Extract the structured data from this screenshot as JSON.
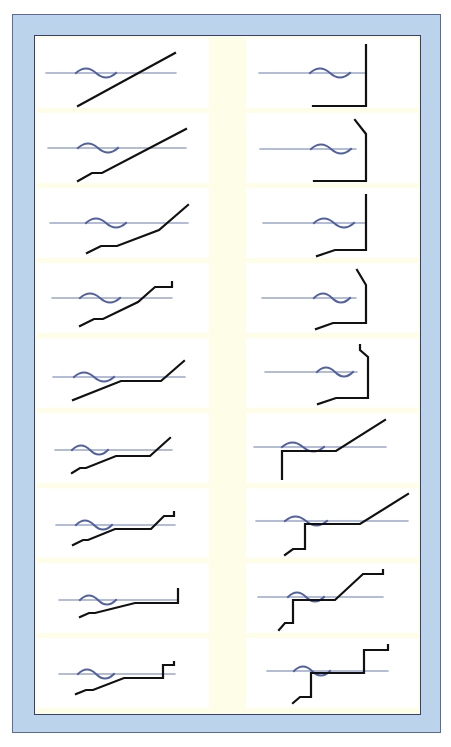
{
  "colors": {
    "frame": "#bcd3ec",
    "frame_border": "#5a6a9a",
    "panel_border": "#3a3f6a",
    "cell_bg": "#ffffff",
    "gap_bg": "#fdfde8",
    "water_line": "#6a7cb0",
    "wave": "#5060a0",
    "profile": "#111111"
  },
  "diagram": {
    "columns": 2,
    "rows": 9,
    "left_column": [
      {
        "id": "L1",
        "shape": "straight sloping beach"
      },
      {
        "id": "L2",
        "shape": "slope with small offshore step"
      },
      {
        "id": "L3",
        "shape": "step, gentle slope, steeper upper beach"
      },
      {
        "id": "L4",
        "shape": "step, slope, steep rise to flat crest with end post"
      },
      {
        "id": "L5",
        "shape": "slope, flat platform at water level, rise"
      },
      {
        "id": "L6",
        "shape": "step, slope, flat platform, rise"
      },
      {
        "id": "L7",
        "shape": "step, slope, flat platform, rise to crest with post"
      },
      {
        "id": "L8",
        "shape": "step, slope, long flat platform ending in vertical wall"
      },
      {
        "id": "L9",
        "shape": "step, slope, flat platform, stepped wall"
      }
    ],
    "right_column": [
      {
        "id": "R1",
        "shape": "vertical seawall with flat toe"
      },
      {
        "id": "R2",
        "shape": "vertical seawall with recurved top"
      },
      {
        "id": "R3",
        "shape": "vertical seawall with sloped toe"
      },
      {
        "id": "R4",
        "shape": "seawall with recurved top and sloped toe"
      },
      {
        "id": "R5",
        "shape": "seawall with offset recurved top and sloped toe"
      },
      {
        "id": "R6",
        "shape": "vertical drop offshore, flat shelf, sloping beach"
      },
      {
        "id": "R7",
        "shape": "stepped drop offshore, shelf, slope, crest post"
      },
      {
        "id": "R8",
        "shape": "stepped drop, shelf, slope to flat crest with post"
      },
      {
        "id": "R9",
        "shape": "stepped drop, shelf, vertical wall to crest with post"
      }
    ]
  }
}
